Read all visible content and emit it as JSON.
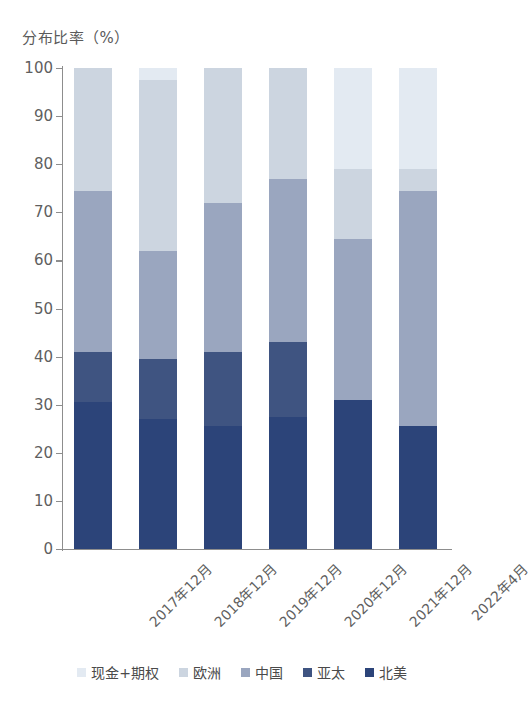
{
  "chart_data": {
    "type": "bar",
    "subtype": "stacked-100",
    "title": "分布比率（%）",
    "xlabel": "",
    "ylabel": "分布比率（%）",
    "ylim": [
      0,
      100
    ],
    "yticks": [
      100,
      90,
      80,
      70,
      60,
      50,
      40,
      30,
      20,
      10,
      0
    ],
    "grid": false,
    "legend_position": "bottom",
    "categories": [
      "2017年12月",
      "2018年12月",
      "2019年12月",
      "2020年12月",
      "2021年12月",
      "2022年4月"
    ],
    "series": [
      {
        "name": "北美",
        "color": "#2c4479",
        "values": [
          30.5,
          27.0,
          25.5,
          27.5,
          31.0,
          25.5
        ]
      },
      {
        "name": "亚太",
        "color": "#3f5481",
        "values": [
          10.5,
          12.5,
          15.5,
          15.5,
          0.0,
          0.0
        ]
      },
      {
        "name": "中国",
        "color": "#9aa6bf",
        "values": [
          33.5,
          22.5,
          31.0,
          34.0,
          33.5,
          49.0
        ]
      },
      {
        "name": "欧洲",
        "color": "#ccd5e0",
        "values": [
          25.5,
          35.5,
          28.0,
          23.0,
          14.5,
          4.5
        ]
      },
      {
        "name": "现金+期权",
        "color": "#e3eaf2",
        "values": [
          0.0,
          2.5,
          0.0,
          0.0,
          21.0,
          21.0
        ]
      }
    ],
    "legend_order": [
      "现金+期权",
      "欧洲",
      "中国",
      "亚太",
      "北美"
    ]
  }
}
